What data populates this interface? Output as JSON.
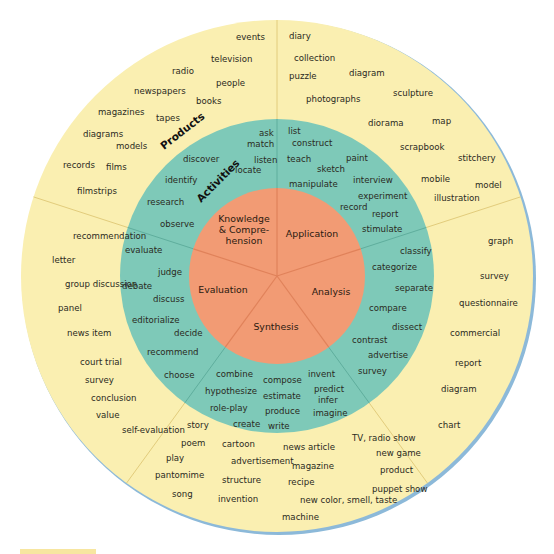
{
  "colors": {
    "products_ring": "#faefb1",
    "activities_ring": "#7ec9b8",
    "core": "#f29b74",
    "outer_edge": "#8cb9d9",
    "divider_outer": "#e2cc7c",
    "divider_inner": "#e0825a",
    "divider_teal": "#5fae9d"
  },
  "ring_labels": {
    "products": "Products",
    "activities": "Activities"
  },
  "core_segments": [
    {
      "name": "knowledge-comprehension",
      "lines": [
        "Knowledge",
        "& Compre-",
        "hension"
      ],
      "x": 244,
      "y": 222
    },
    {
      "name": "application",
      "lines": [
        "Application"
      ],
      "x": 312,
      "y": 237
    },
    {
      "name": "analysis",
      "lines": [
        "Analysis"
      ],
      "x": 331,
      "y": 295
    },
    {
      "name": "evaluation",
      "lines": [
        "Evaluation"
      ],
      "x": 223,
      "y": 293
    },
    {
      "name": "synthesis",
      "lines": [
        "Synthesis"
      ],
      "x": 276,
      "y": 330
    }
  ],
  "activities": {
    "knowledge_comprehension": [
      {
        "t": "ask",
        "x": 259,
        "y": 136
      },
      {
        "t": "match",
        "x": 247,
        "y": 147
      },
      {
        "t": "discover",
        "x": 183,
        "y": 162
      },
      {
        "t": "listen",
        "x": 254,
        "y": 163
      },
      {
        "t": "locate",
        "x": 235,
        "y": 173
      },
      {
        "t": "identify",
        "x": 165,
        "y": 183
      },
      {
        "t": "research",
        "x": 147,
        "y": 205
      },
      {
        "t": "observe",
        "x": 160,
        "y": 227
      }
    ],
    "application": [
      {
        "t": "list",
        "x": 288,
        "y": 134
      },
      {
        "t": "construct",
        "x": 292,
        "y": 146
      },
      {
        "t": "teach",
        "x": 287,
        "y": 162
      },
      {
        "t": "paint",
        "x": 346,
        "y": 161
      },
      {
        "t": "sketch",
        "x": 317,
        "y": 172
      },
      {
        "t": "manipulate",
        "x": 289,
        "y": 187
      },
      {
        "t": "interview",
        "x": 353,
        "y": 183
      },
      {
        "t": "experiment",
        "x": 358,
        "y": 199
      },
      {
        "t": "record",
        "x": 340,
        "y": 210
      },
      {
        "t": "report",
        "x": 372,
        "y": 217
      },
      {
        "t": "stimulate",
        "x": 362,
        "y": 232
      }
    ],
    "analysis": [
      {
        "t": "classify",
        "x": 400,
        "y": 254
      },
      {
        "t": "categorize",
        "x": 372,
        "y": 270
      },
      {
        "t": "separate",
        "x": 395,
        "y": 291
      },
      {
        "t": "compare",
        "x": 369,
        "y": 311
      },
      {
        "t": "dissect",
        "x": 392,
        "y": 330
      },
      {
        "t": "contrast",
        "x": 352,
        "y": 343
      },
      {
        "t": "advertise",
        "x": 368,
        "y": 358
      },
      {
        "t": "survey",
        "x": 358,
        "y": 374
      }
    ],
    "evaluation": [
      {
        "t": "evaluate",
        "x": 125,
        "y": 253
      },
      {
        "t": "judge",
        "x": 158,
        "y": 275
      },
      {
        "t": "debate",
        "x": 122,
        "y": 289
      },
      {
        "t": "discuss",
        "x": 153,
        "y": 302
      },
      {
        "t": "editorialize",
        "x": 132,
        "y": 323
      },
      {
        "t": "decide",
        "x": 174,
        "y": 336
      },
      {
        "t": "recommend",
        "x": 147,
        "y": 355
      },
      {
        "t": "choose",
        "x": 164,
        "y": 378
      }
    ],
    "synthesis": [
      {
        "t": "combine",
        "x": 216,
        "y": 377
      },
      {
        "t": "invent",
        "x": 308,
        "y": 377
      },
      {
        "t": "compose",
        "x": 263,
        "y": 383
      },
      {
        "t": "hypothesize",
        "x": 205,
        "y": 394
      },
      {
        "t": "predict",
        "x": 314,
        "y": 392
      },
      {
        "t": "estimate",
        "x": 263,
        "y": 399
      },
      {
        "t": "infer",
        "x": 318,
        "y": 403
      },
      {
        "t": "role-play",
        "x": 210,
        "y": 411
      },
      {
        "t": "produce",
        "x": 265,
        "y": 414
      },
      {
        "t": "imagine",
        "x": 313,
        "y": 416
      },
      {
        "t": "create",
        "x": 233,
        "y": 427
      },
      {
        "t": "write",
        "x": 268,
        "y": 429
      }
    ]
  },
  "products": {
    "knowledge_comprehension": [
      {
        "t": "events",
        "x": 236,
        "y": 40
      },
      {
        "t": "television",
        "x": 211,
        "y": 62
      },
      {
        "t": "radio",
        "x": 172,
        "y": 74
      },
      {
        "t": "people",
        "x": 216,
        "y": 86
      },
      {
        "t": "newspapers",
        "x": 134,
        "y": 94
      },
      {
        "t": "books",
        "x": 196,
        "y": 104
      },
      {
        "t": "magazines",
        "x": 98,
        "y": 115
      },
      {
        "t": "tapes",
        "x": 156,
        "y": 121
      },
      {
        "t": "diagrams",
        "x": 83,
        "y": 137
      },
      {
        "t": "models",
        "x": 116,
        "y": 149
      },
      {
        "t": "records",
        "x": 63,
        "y": 168
      },
      {
        "t": "films",
        "x": 106,
        "y": 170
      },
      {
        "t": "filmstrips",
        "x": 77,
        "y": 194
      }
    ],
    "application": [
      {
        "t": "diary",
        "x": 289,
        "y": 39
      },
      {
        "t": "collection",
        "x": 294,
        "y": 61
      },
      {
        "t": "puzzle",
        "x": 289,
        "y": 79
      },
      {
        "t": "diagram",
        "x": 349,
        "y": 76
      },
      {
        "t": "photographs",
        "x": 306,
        "y": 102
      },
      {
        "t": "sculpture",
        "x": 393,
        "y": 96
      },
      {
        "t": "diorama",
        "x": 368,
        "y": 126
      },
      {
        "t": "map",
        "x": 432,
        "y": 124
      },
      {
        "t": "scrapbook",
        "x": 400,
        "y": 150
      },
      {
        "t": "stitchery",
        "x": 458,
        "y": 161
      },
      {
        "t": "mobile",
        "x": 421,
        "y": 182
      },
      {
        "t": "model",
        "x": 475,
        "y": 188
      },
      {
        "t": "illustration",
        "x": 434,
        "y": 201
      }
    ],
    "analysis": [
      {
        "t": "graph",
        "x": 488,
        "y": 244
      },
      {
        "t": "survey",
        "x": 480,
        "y": 279
      },
      {
        "t": "questionnaire",
        "x": 459,
        "y": 306
      },
      {
        "t": "commercial",
        "x": 450,
        "y": 336
      },
      {
        "t": "report",
        "x": 455,
        "y": 366
      },
      {
        "t": "diagram",
        "x": 441,
        "y": 392
      },
      {
        "t": "chart",
        "x": 438,
        "y": 428
      }
    ],
    "evaluation": [
      {
        "t": "recommendation",
        "x": 73,
        "y": 239
      },
      {
        "t": "letter",
        "x": 52,
        "y": 263
      },
      {
        "t": "group discussion",
        "x": 65,
        "y": 287
      },
      {
        "t": "panel",
        "x": 58,
        "y": 311
      },
      {
        "t": "news item",
        "x": 67,
        "y": 336
      },
      {
        "t": "court trial",
        "x": 80,
        "y": 365
      },
      {
        "t": "survey",
        "x": 85,
        "y": 383
      },
      {
        "t": "conclusion",
        "x": 91,
        "y": 401
      },
      {
        "t": "value",
        "x": 96,
        "y": 418
      },
      {
        "t": "self-evaluation",
        "x": 122,
        "y": 433
      }
    ],
    "synthesis": [
      {
        "t": "story",
        "x": 187,
        "y": 428
      },
      {
        "t": "poem",
        "x": 181,
        "y": 446
      },
      {
        "t": "cartoon",
        "x": 222,
        "y": 447
      },
      {
        "t": "news article",
        "x": 283,
        "y": 450
      },
      {
        "t": "TV, radio show",
        "x": 352,
        "y": 441
      },
      {
        "t": "play",
        "x": 166,
        "y": 461
      },
      {
        "t": "advertisement",
        "x": 231,
        "y": 464
      },
      {
        "t": "magazine",
        "x": 292,
        "y": 469
      },
      {
        "t": "new game",
        "x": 376,
        "y": 456
      },
      {
        "t": "pantomime",
        "x": 155,
        "y": 478
      },
      {
        "t": "structure",
        "x": 222,
        "y": 483
      },
      {
        "t": "recipe",
        "x": 288,
        "y": 485
      },
      {
        "t": "product",
        "x": 380,
        "y": 473
      },
      {
        "t": "puppet show",
        "x": 372,
        "y": 492
      },
      {
        "t": "song",
        "x": 172,
        "y": 497
      },
      {
        "t": "invention",
        "x": 218,
        "y": 502
      },
      {
        "t": "new color, smell, taste",
        "x": 300,
        "y": 503
      },
      {
        "t": "machine",
        "x": 282,
        "y": 520
      }
    ]
  }
}
